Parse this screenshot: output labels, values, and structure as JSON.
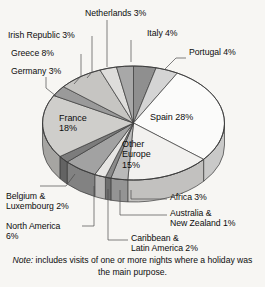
{
  "note": {
    "prefix": "Note:",
    "text": " includes visits of one or more nights where a holiday was the main purpose."
  },
  "colors": {
    "background": "#f7f6f3",
    "outline": "#3a3a3a",
    "text": "#0d0d0d"
  },
  "chart_data": {
    "type": "pie",
    "title": "",
    "subtitle": "",
    "xlabel": "",
    "ylabel": "",
    "legend_position": "none",
    "grid": false,
    "units": "percent",
    "start_angle_deg": 0,
    "direction": "clockwise",
    "three_d": true,
    "labels": [
      "Italy",
      "Portugal",
      "Spain",
      "Other Europe",
      "Africa",
      "Australia & New Zealand",
      "Caribbean & Latin America",
      "North America",
      "Belgium & Luxembourg",
      "France",
      "Germany",
      "Greece",
      "Irish Republic",
      "Netherlands"
    ],
    "values": [
      4,
      4,
      28,
      15,
      3,
      1,
      2,
      6,
      2,
      18,
      3,
      8,
      3,
      3
    ],
    "slices": [
      {
        "label": "Italy",
        "value": 4,
        "display": "Italy 4%",
        "color": "#8f8f8f",
        "label_mode": "outside"
      },
      {
        "label": "Portugal",
        "value": 4,
        "display": "Portugal 4%",
        "color": "#d4d4d4",
        "label_mode": "outside"
      },
      {
        "label": "Spain",
        "value": 28,
        "display": "Spain 28%",
        "color": "#fbfbfa",
        "label_mode": "inside"
      },
      {
        "label": "Other Europe",
        "value": 15,
        "display": "Other\nEurope\n15%",
        "color": "#f2f1ef",
        "label_mode": "inside"
      },
      {
        "label": "Africa",
        "value": 3,
        "display": "Africa 3%",
        "color": "#b9b9b9",
        "label_mode": "outside"
      },
      {
        "label": "Australia & New Zealand",
        "value": 1,
        "display": "Australia &\nNew Zealand 1%",
        "color": "#8a8a8a",
        "label_mode": "outside"
      },
      {
        "label": "Caribbean & Latin America",
        "value": 2,
        "display": "Caribbean &\nLatin America 2%",
        "color": "#e6e5e3",
        "label_mode": "outside"
      },
      {
        "label": "North America",
        "value": 6,
        "display": "North America\n6%",
        "color": "#a2a2a2",
        "label_mode": "outside"
      },
      {
        "label": "Belgium & Luxembourg",
        "value": 2,
        "display": "Belgium &\nLuxembourg 2%",
        "color": "#7c7c7c",
        "label_mode": "outside"
      },
      {
        "label": "France",
        "value": 18,
        "display": "France\n18%",
        "color": "#cfcecb",
        "label_mode": "inside"
      },
      {
        "label": "Germany",
        "value": 3,
        "display": "Germany 3%",
        "color": "#9a9a9a",
        "label_mode": "outside"
      },
      {
        "label": "Greece",
        "value": 8,
        "display": "Greece 8%",
        "color": "#c6c5c2",
        "label_mode": "outside"
      },
      {
        "label": "Irish Republic",
        "value": 3,
        "display": "Irish Republic 3%",
        "color": "#dedddb",
        "label_mode": "outside"
      },
      {
        "label": "Netherlands",
        "value": 3,
        "display": "Netherlands 3%",
        "color": "#a8a8a8",
        "label_mode": "outside"
      }
    ]
  },
  "labels_outside": {
    "netherlands": "Netherlands 3%",
    "italy": "Italy 4%",
    "portugal": "Portugal 4%",
    "irish_republic": "Irish Republic 3%",
    "greece": "Greece 8%",
    "germany": "Germany 3%",
    "belgium": "Belgium &\nLuxembourg 2%",
    "north_america": "North America\n6%",
    "caribbean": "Caribbean &\nLatin America 2%",
    "australia": "Australia &\nNew Zealand 1%",
    "africa": "Africa 3%"
  },
  "labels_inside": {
    "spain": "Spain 28%",
    "other_europe": "Other\nEurope\n15%",
    "france": "France\n18%"
  }
}
